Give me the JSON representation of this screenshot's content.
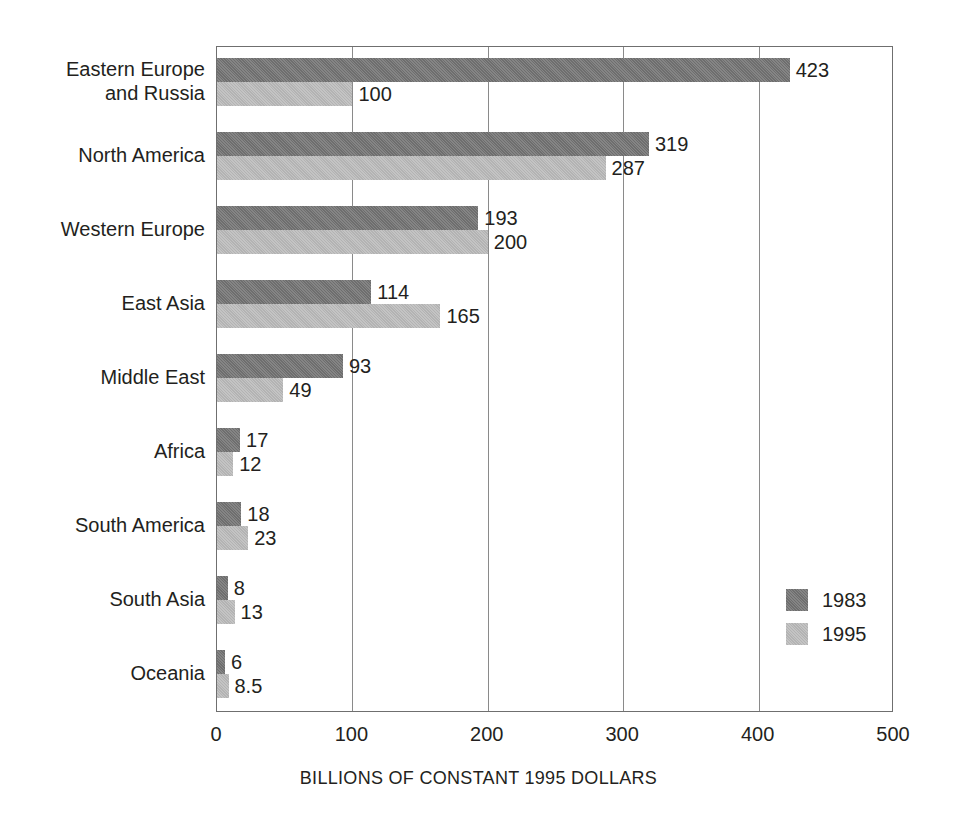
{
  "chart_data": {
    "type": "bar",
    "orientation": "horizontal",
    "title": "",
    "xlabel": "BILLIONS OF CONSTANT 1995 DOLLARS",
    "ylabel": "",
    "xlim": [
      0,
      500
    ],
    "xticks": [
      "0",
      "100",
      "200",
      "300",
      "400",
      "500"
    ],
    "grid": true,
    "legend_position": "bottom-right",
    "categories": [
      "Eastern Europe\nand Russia",
      "North America",
      "Western Europe",
      "East Asia",
      "Middle East",
      "Africa",
      "South America",
      "South Asia",
      "Oceania"
    ],
    "series": [
      {
        "name": "1983",
        "color": "#6e6e6e",
        "values": [
          423,
          319,
          193,
          114,
          93,
          17,
          18,
          8,
          6
        ],
        "labels": [
          "423",
          "319",
          "193",
          "114",
          "93",
          "17",
          "18",
          "8",
          "6"
        ]
      },
      {
        "name": "1995",
        "color": "#b3b3b3",
        "values": [
          100,
          287,
          200,
          165,
          49,
          12,
          23,
          13,
          8.5
        ],
        "labels": [
          "100",
          "287",
          "200",
          "165",
          "49",
          "12",
          "23",
          "13",
          "8.5"
        ]
      }
    ]
  },
  "legend": {
    "items": [
      {
        "label": "1983",
        "color": "#6e6e6e"
      },
      {
        "label": "1995",
        "color": "#b3b3b3"
      }
    ]
  }
}
